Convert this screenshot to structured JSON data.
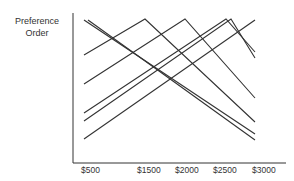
{
  "chart_data": {
    "type": "line",
    "title": "",
    "xlabel": "",
    "ylabel": "Preference Order",
    "ylabel_lines": [
      "Preference",
      "Order"
    ],
    "x_tick_labels": [
      "$500",
      "$1500",
      "$2000",
      "$2500",
      "$3000"
    ],
    "x": [
      500,
      3000
    ],
    "grid": false,
    "legend": null,
    "line_color": "#333333",
    "series": [
      {
        "name": "line-1",
        "points": [
          [
            500,
            7.0
          ],
          [
            3000,
            1.9
          ]
        ]
      },
      {
        "name": "line-2",
        "points": [
          [
            560,
            7.0
          ],
          [
            3000,
            1.7
          ]
        ]
      },
      {
        "name": "line-3",
        "points": [
          [
            500,
            6.0
          ],
          [
            1400,
            7.0
          ],
          [
            3000,
            2.4
          ]
        ]
      },
      {
        "name": "line-4",
        "points": [
          [
            500,
            5.2
          ],
          [
            2000,
            7.0
          ],
          [
            3000,
            3.1
          ]
        ]
      },
      {
        "name": "line-5",
        "points": [
          [
            500,
            4.4
          ],
          [
            2580,
            7.0
          ],
          [
            3000,
            6.1
          ]
        ]
      },
      {
        "name": "line-6",
        "points": [
          [
            500,
            4.2
          ],
          [
            2650,
            7.0
          ],
          [
            3000,
            5.9
          ]
        ]
      },
      {
        "name": "line-7",
        "points": [
          [
            500,
            3.6
          ],
          [
            3000,
            7.0
          ]
        ]
      }
    ],
    "pixel_polylines": [
      "84,20 255,134",
      "88,20 255,140",
      "84,55 145,19 255,122",
      "84,84 185,19 255,98",
      "84,113 226,19 255,52",
      "84,121 231,19 255,58",
      "84,139 255,20"
    ]
  },
  "axis": {
    "ticks": [
      {
        "label": "$500",
        "left": 81
      },
      {
        "label": "$1500",
        "left": 137
      },
      {
        "label": "$2000",
        "left": 175
      },
      {
        "label": "$2500",
        "left": 213
      },
      {
        "label": "$3000",
        "left": 252
      }
    ]
  }
}
